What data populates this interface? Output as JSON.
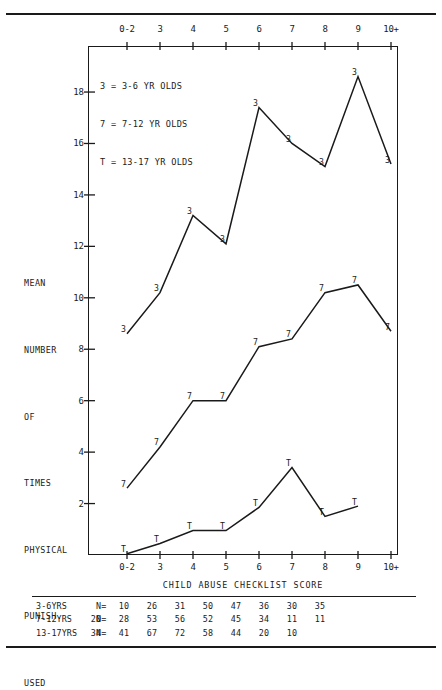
{
  "chart_data": {
    "type": "line",
    "title": "",
    "xlabel": "CHILD ABUSE CHECKLIST SCORE",
    "ylabel": "MEAN NUMBER OF TIMES PHYSICAL PUNISH. USED",
    "ylabel_lines": [
      "MEAN",
      "NUMBER",
      "OF",
      "TIMES",
      "PHYSICAL",
      "PUNISH.",
      "USED"
    ],
    "categories": [
      "0-2",
      "3",
      "4",
      "5",
      "6",
      "7",
      "8",
      "9",
      "10+"
    ],
    "xtick_labels_top": [
      "0-2",
      "3",
      "4",
      "5",
      "6",
      "7",
      "8",
      "9",
      "10+"
    ],
    "xtick_labels_bottom": [
      "0-2",
      "3",
      "4",
      "5",
      "6",
      "7",
      "8",
      "9",
      "10+"
    ],
    "ytick_labels": [
      "2",
      "4",
      "6",
      "8",
      "10",
      "12",
      "14",
      "16",
      "18"
    ],
    "ytick_values": [
      2,
      4,
      6,
      8,
      10,
      12,
      14,
      16,
      18
    ],
    "ylim": [
      0,
      19.2
    ],
    "grid": false,
    "legend_position": "top-left",
    "legend": [
      {
        "marker": "3",
        "label": "3 = 3-6 YR OLDS"
      },
      {
        "marker": "7",
        "label": "7 = 7-12 YR OLDS"
      },
      {
        "marker": "T",
        "label": "T = 13-17 YR OLDS"
      }
    ],
    "series": [
      {
        "name": "3-6 YR OLDS",
        "marker": "3",
        "x": [
          "0-2",
          "3",
          "4",
          "5",
          "6",
          "7",
          "8",
          "9",
          "10+"
        ],
        "values": [
          8.6,
          10.2,
          13.2,
          12.1,
          17.4,
          16.0,
          15.1,
          18.6,
          15.2
        ]
      },
      {
        "name": "7-12 YR OLDS",
        "marker": "7",
        "x": [
          "0-2",
          "3",
          "4",
          "5",
          "6",
          "7",
          "8",
          "9",
          "10+"
        ],
        "values": [
          2.6,
          4.2,
          6.0,
          6.0,
          8.1,
          8.4,
          10.2,
          10.5,
          8.7
        ]
      },
      {
        "name": "13-17 YR OLDS",
        "marker": "T",
        "x": [
          "0-2",
          "3",
          "4",
          "5",
          "6",
          "7",
          "8",
          "9"
        ],
        "values": [
          0.05,
          0.45,
          0.95,
          0.95,
          1.85,
          3.4,
          1.5,
          1.9
        ]
      }
    ]
  },
  "n_table": {
    "n_prefix": "N=",
    "rows": [
      {
        "label": "3-6YRS",
        "values": [
          "",
          "10",
          "26",
          "31",
          "50",
          "47",
          "36",
          "30",
          "35"
        ]
      },
      {
        "label": "7-12YRS",
        "values": [
          "20",
          "28",
          "53",
          "56",
          "52",
          "45",
          "34",
          "11",
          "11"
        ]
      },
      {
        "label": "13-17YRS",
        "values": [
          "34",
          "41",
          "67",
          "72",
          "58",
          "44",
          "20",
          "10",
          ""
        ]
      }
    ]
  }
}
